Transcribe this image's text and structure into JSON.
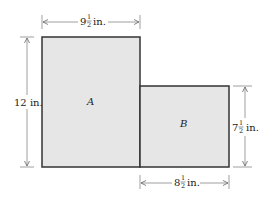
{
  "diagram": {
    "colors": {
      "fill": "#e6e6e6",
      "stroke": "#333333",
      "dim_line": "#555555"
    },
    "shapes": [
      {
        "id": "A",
        "label": "A"
      },
      {
        "id": "B",
        "label": "B"
      }
    ],
    "dimensions": {
      "top_width": {
        "whole": "9",
        "num": "1",
        "den": "2",
        "unit": "in."
      },
      "left_height": {
        "text": "12 in."
      },
      "right_height": {
        "whole": "7",
        "num": "1",
        "den": "2",
        "unit": "in."
      },
      "bottom_width": {
        "whole": "8",
        "num": "1",
        "den": "2",
        "unit": "in."
      }
    }
  }
}
